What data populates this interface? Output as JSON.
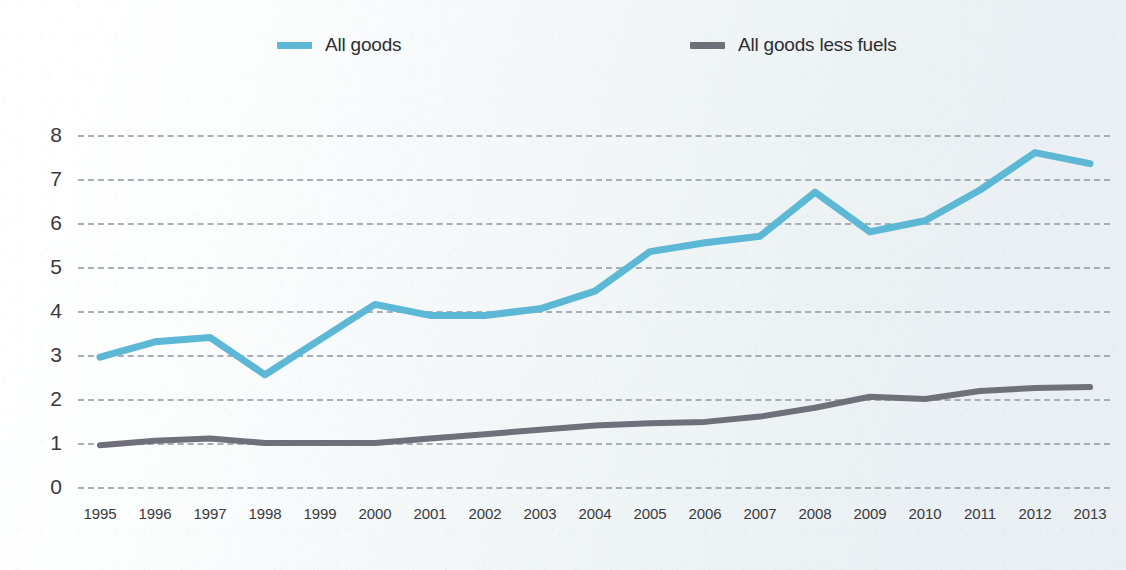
{
  "legend": {
    "position": "top",
    "entries": [
      {
        "label": "All goods",
        "color": "#5cb8d4",
        "icon": "line-swatch-icon"
      },
      {
        "label": "All goods less fuels",
        "color": "#70707a",
        "icon": "line-swatch-icon"
      }
    ]
  },
  "axes": {
    "y_ticks": [
      "8",
      "7",
      "6",
      "5",
      "4",
      "3",
      "2",
      "1",
      "0"
    ],
    "x_ticks": [
      "1995",
      "1996",
      "1997",
      "1998",
      "1999",
      "2000",
      "2001",
      "2002",
      "2003",
      "2004",
      "2005",
      "2006",
      "2007",
      "2008",
      "2009",
      "2010",
      "2011",
      "2012",
      "2013"
    ]
  },
  "chart_data": {
    "type": "line",
    "title": "",
    "subtitle": "",
    "xlabel": "",
    "ylabel": "",
    "x": [
      1995,
      1996,
      1997,
      1998,
      1999,
      2000,
      2001,
      2002,
      2003,
      2004,
      2005,
      2006,
      2007,
      2008,
      2009,
      2010,
      2011,
      2012,
      2013
    ],
    "categories": [
      "1995",
      "1996",
      "1997",
      "1998",
      "1999",
      "2000",
      "2001",
      "2002",
      "2003",
      "2004",
      "2005",
      "2006",
      "2007",
      "2008",
      "2009",
      "2010",
      "2011",
      "2012",
      "2013"
    ],
    "series": [
      {
        "name": "All goods",
        "color": "#5cb8d4",
        "values": [
          2.95,
          3.3,
          3.4,
          2.55,
          3.35,
          4.15,
          3.9,
          3.9,
          4.05,
          4.45,
          5.35,
          5.55,
          5.7,
          6.7,
          5.8,
          6.05,
          6.75,
          7.6,
          7.35
        ]
      },
      {
        "name": "All goods less fuels",
        "color": "#70707a",
        "values": [
          0.95,
          1.05,
          1.1,
          1.0,
          1.0,
          1.0,
          1.1,
          1.2,
          1.3,
          1.4,
          1.45,
          1.48,
          1.6,
          1.8,
          2.05,
          2.0,
          2.18,
          2.25,
          2.27
        ]
      }
    ],
    "ylim": [
      0,
      8
    ],
    "xlim": [
      1995,
      2013
    ],
    "grid": {
      "horizontal": true,
      "vertical": false,
      "style": "dashed"
    },
    "legend_position": "top"
  },
  "geometry": {
    "plot_left": 100,
    "plot_right": 1090,
    "y_zero_px": 487,
    "px_per_unit": 44
  }
}
